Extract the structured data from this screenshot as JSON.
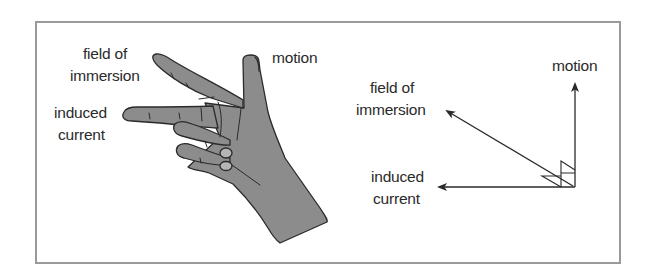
{
  "diagram": {
    "colors": {
      "frame": "#9a9a9a",
      "hand_fill": "#8c8c8c",
      "hand_outline": "#2a2a2a",
      "nail_fill": "#b5b5b5",
      "arrow": "#2a2a2a",
      "text": "#2a2a2a"
    },
    "hand": {
      "labels": {
        "field_line1": "field of",
        "field_line2": "immersion",
        "current_line1": "induced",
        "current_line2": "current",
        "motion": "motion"
      }
    },
    "vectors": {
      "labels": {
        "motion": "motion",
        "field_line1": "field of",
        "field_line2": "immersion",
        "current_line1": "induced",
        "current_line2": "current"
      },
      "arrows": [
        {
          "name": "motion",
          "direction": "up"
        },
        {
          "name": "field of immersion",
          "direction": "up-left"
        },
        {
          "name": "induced current",
          "direction": "left"
        }
      ]
    }
  }
}
